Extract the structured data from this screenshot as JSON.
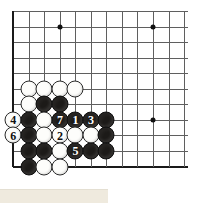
{
  "diagram": {
    "board_size": 19,
    "visible_region": "bottom-left / left-side corner",
    "grid": {
      "origin_x": 13,
      "origin_y": 11,
      "spacing_x": 15.55,
      "spacing_y": 15.55,
      "cols": 12,
      "rows": 11,
      "line_color": "#5f5f5f",
      "edge_color": "#1a1a1a",
      "background": "#ffffff"
    },
    "star_points": [
      {
        "col": 3,
        "row": 1
      },
      {
        "col": 9,
        "row": 1
      },
      {
        "col": 9,
        "row": 7
      }
    ],
    "stones": [
      {
        "col": 1,
        "row": 5,
        "color": "white",
        "label": ""
      },
      {
        "col": 2,
        "row": 5,
        "color": "white",
        "label": ""
      },
      {
        "col": 3,
        "row": 5,
        "color": "white",
        "label": ""
      },
      {
        "col": 4,
        "row": 5,
        "color": "white",
        "label": ""
      },
      {
        "col": 1,
        "row": 6,
        "color": "white",
        "label": ""
      },
      {
        "col": 2,
        "row": 6,
        "color": "black",
        "label": ""
      },
      {
        "col": 3,
        "row": 6,
        "color": "black",
        "label": ""
      },
      {
        "col": 0,
        "row": 7,
        "color": "white",
        "label": "4"
      },
      {
        "col": 1,
        "row": 7,
        "color": "black",
        "label": ""
      },
      {
        "col": 2,
        "row": 7,
        "color": "white",
        "label": ""
      },
      {
        "col": 3,
        "row": 7,
        "color": "black",
        "label": "7"
      },
      {
        "col": 4,
        "row": 7,
        "color": "black",
        "label": "1"
      },
      {
        "col": 5,
        "row": 7,
        "color": "black",
        "label": "3"
      },
      {
        "col": 6,
        "row": 7,
        "color": "black",
        "label": ""
      },
      {
        "col": 0,
        "row": 8,
        "color": "white",
        "label": "6"
      },
      {
        "col": 1,
        "row": 8,
        "color": "black",
        "label": ""
      },
      {
        "col": 2,
        "row": 8,
        "color": "white",
        "label": ""
      },
      {
        "col": 3,
        "row": 8,
        "color": "white",
        "label": "2"
      },
      {
        "col": 4,
        "row": 8,
        "color": "white",
        "label": ""
      },
      {
        "col": 5,
        "row": 8,
        "color": "white",
        "label": ""
      },
      {
        "col": 6,
        "row": 8,
        "color": "black",
        "label": ""
      },
      {
        "col": 1,
        "row": 9,
        "color": "black",
        "label": ""
      },
      {
        "col": 2,
        "row": 9,
        "color": "black",
        "label": ""
      },
      {
        "col": 3,
        "row": 9,
        "color": "white",
        "label": ""
      },
      {
        "col": 4,
        "row": 9,
        "color": "black",
        "label": "5"
      },
      {
        "col": 5,
        "row": 9,
        "color": "black",
        "label": ""
      },
      {
        "col": 6,
        "row": 9,
        "color": "black",
        "label": ""
      },
      {
        "col": 1,
        "row": 10,
        "color": "black",
        "label": ""
      },
      {
        "col": 2,
        "row": 10,
        "color": "white",
        "label": ""
      },
      {
        "col": 3,
        "row": 10,
        "color": "white",
        "label": ""
      }
    ],
    "move_sequence": [
      {
        "number": "1",
        "color": "black"
      },
      {
        "number": "2",
        "color": "white"
      },
      {
        "number": "3",
        "color": "black"
      },
      {
        "number": "4",
        "color": "white"
      },
      {
        "number": "5",
        "color": "black"
      },
      {
        "number": "6",
        "color": "white"
      },
      {
        "number": "7",
        "color": "black"
      }
    ],
    "caption": {
      "text": ""
    }
  }
}
